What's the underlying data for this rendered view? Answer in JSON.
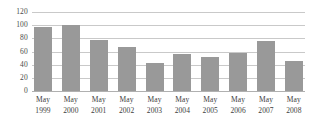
{
  "chart_data": {
    "type": "bar",
    "title": "",
    "subtitle": "",
    "xlabel": "",
    "ylabel": "",
    "ylim": [
      0,
      120
    ],
    "yticks": [
      120,
      100,
      80,
      60,
      40,
      20,
      0
    ],
    "ytick_labels": [
      "120",
      "100",
      "80",
      "60",
      "40",
      "20",
      "0"
    ],
    "grid": true,
    "legend": null,
    "bar_color": "#999999",
    "gridline_color": "#c9c9c9",
    "categories": [
      "May 1999",
      "May 2000",
      "May 2001",
      "May 2002",
      "May 2003",
      "May 2004",
      "May 2005",
      "May 2006",
      "May 2007",
      "May 2008"
    ],
    "category_parts": [
      {
        "month": "May",
        "year": "1999"
      },
      {
        "month": "May",
        "year": "2000"
      },
      {
        "month": "May",
        "year": "2001"
      },
      {
        "month": "May",
        "year": "2002"
      },
      {
        "month": "May",
        "year": "2003"
      },
      {
        "month": "May",
        "year": "2004"
      },
      {
        "month": "May",
        "year": "2005"
      },
      {
        "month": "May",
        "year": "2006"
      },
      {
        "month": "May",
        "year": "2007"
      },
      {
        "month": "May",
        "year": "2008"
      }
    ],
    "values": [
      97,
      100,
      78,
      67,
      43,
      56,
      51,
      57,
      76,
      46
    ]
  }
}
